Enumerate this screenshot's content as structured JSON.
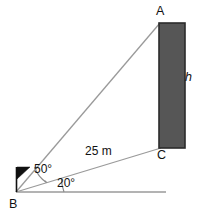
{
  "diagram": {
    "type": "trigonometry-elevation-diagram",
    "points": {
      "A": {
        "label": "A",
        "x": 160,
        "y": 23,
        "role": "top-of-building"
      },
      "B": {
        "label": "B",
        "x": 16,
        "y": 192,
        "role": "observer-vertex"
      },
      "C": {
        "label": "C",
        "x": 160,
        "y": 148,
        "role": "base-of-building"
      }
    },
    "building": {
      "label": "h",
      "height_label": "h",
      "x": 159,
      "y": 23,
      "width": 26,
      "height": 125,
      "fill_color": "#565656",
      "border_color": "#2b2b2b"
    },
    "segments": [
      {
        "name": "line-of-sight-to-top",
        "from": "B",
        "to": "A",
        "label": ""
      },
      {
        "name": "line-of-sight-to-base",
        "from": "B",
        "to": "C",
        "label": "25 m"
      },
      {
        "name": "horizontal-ground-line",
        "from": "B",
        "to": "X",
        "label": ""
      }
    ],
    "distance_label": "25 m",
    "angles": [
      {
        "name": "angle-ABC",
        "label": "50°",
        "value": 50,
        "unit": "degrees",
        "arc_radius": 30
      },
      {
        "name": "angle-CB-horizontal",
        "label": "20°",
        "value": 20,
        "unit": "degrees",
        "arc_radius": 47
      }
    ],
    "marker": {
      "name": "observer-flag-marker",
      "description": "vertical pole with filled right-pointing triangle at B"
    },
    "colors": {
      "line": "#9a9a9a",
      "arc": "#8c8c8c",
      "text": "#111111",
      "building_fill": "#565656",
      "building_border": "#2b2b2b",
      "marker": "#111111",
      "background": "#ffffff"
    }
  }
}
